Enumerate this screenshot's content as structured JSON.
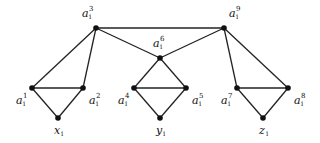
{
  "diagram": {
    "title": "",
    "nodes": [
      {
        "id": "a3",
        "base": "a",
        "sub": "i",
        "sup": "3",
        "x": 96,
        "y": 28,
        "lx": 82,
        "ly": 17
      },
      {
        "id": "a9",
        "base": "a",
        "sub": "i",
        "sup": "9",
        "x": 224,
        "y": 28,
        "lx": 229,
        "ly": 17
      },
      {
        "id": "a6",
        "base": "a",
        "sub": "i",
        "sup": "6",
        "x": 160,
        "y": 58,
        "lx": 153,
        "ly": 47
      },
      {
        "id": "a1",
        "base": "a",
        "sub": "i",
        "sup": "1",
        "x": 32,
        "y": 88,
        "lx": 16,
        "ly": 104
      },
      {
        "id": "a2",
        "base": "a",
        "sub": "i",
        "sup": "2",
        "x": 83,
        "y": 88,
        "lx": 89,
        "ly": 104
      },
      {
        "id": "x",
        "base": "x",
        "sub": "i",
        "sup": "",
        "x": 58,
        "y": 118,
        "lx": 54,
        "ly": 134
      },
      {
        "id": "a4",
        "base": "a",
        "sub": "i",
        "sup": "4",
        "x": 134,
        "y": 88,
        "lx": 118,
        "ly": 104
      },
      {
        "id": "a5",
        "base": "a",
        "sub": "i",
        "sup": "5",
        "x": 186,
        "y": 88,
        "lx": 192,
        "ly": 104
      },
      {
        "id": "y",
        "base": "y",
        "sub": "i",
        "sup": "",
        "x": 160,
        "y": 118,
        "lx": 156,
        "ly": 134
      },
      {
        "id": "a7",
        "base": "a",
        "sub": "i",
        "sup": "7",
        "x": 237,
        "y": 88,
        "lx": 221,
        "ly": 104
      },
      {
        "id": "a8",
        "base": "a",
        "sub": "i",
        "sup": "8",
        "x": 288,
        "y": 88,
        "lx": 294,
        "ly": 104
      },
      {
        "id": "z",
        "base": "z",
        "sub": "i",
        "sup": "",
        "x": 263,
        "y": 118,
        "lx": 259,
        "ly": 134
      }
    ],
    "edges": [
      [
        "a3",
        "a9"
      ],
      [
        "a3",
        "a6"
      ],
      [
        "a9",
        "a6"
      ],
      [
        "a3",
        "a1"
      ],
      [
        "a3",
        "a2"
      ],
      [
        "a1",
        "a2"
      ],
      [
        "a1",
        "x"
      ],
      [
        "a2",
        "x"
      ],
      [
        "a6",
        "a4"
      ],
      [
        "a6",
        "a5"
      ],
      [
        "a4",
        "a5"
      ],
      [
        "a4",
        "y"
      ],
      [
        "a5",
        "y"
      ],
      [
        "a9",
        "a7"
      ],
      [
        "a9",
        "a8"
      ],
      [
        "a7",
        "a8"
      ],
      [
        "a7",
        "z"
      ],
      [
        "a8",
        "z"
      ]
    ],
    "colors": {
      "edge": "#222222",
      "node": "#111111",
      "background": "#ffffff"
    }
  }
}
